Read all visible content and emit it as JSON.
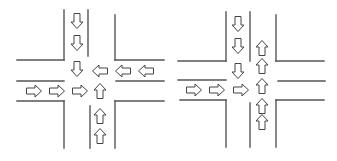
{
  "colors": {
    "background": "#ffffff",
    "road_line": "#555555",
    "arrow_outline": "#444444",
    "arrow_fill": "#ffffff"
  },
  "diagrams": [
    {
      "id": "left-intersection",
      "road_lines": [
        {
          "x1": 64,
          "y1": 10,
          "x2": 64,
          "y2": 60
        },
        {
          "x1": 17,
          "y1": 60,
          "x2": 64,
          "y2": 60
        },
        {
          "x1": 88,
          "y1": 10,
          "x2": 88,
          "y2": 56
        },
        {
          "x1": 115,
          "y1": 15,
          "x2": 115,
          "y2": 60
        },
        {
          "x1": 115,
          "y1": 60,
          "x2": 164,
          "y2": 60
        },
        {
          "x1": 17,
          "y1": 81,
          "x2": 64,
          "y2": 81
        },
        {
          "x1": 116,
          "y1": 81,
          "x2": 164,
          "y2": 81
        },
        {
          "x1": 17,
          "y1": 101,
          "x2": 64,
          "y2": 101
        },
        {
          "x1": 64,
          "y1": 101,
          "x2": 64,
          "y2": 148
        },
        {
          "x1": 90,
          "y1": 106,
          "x2": 90,
          "y2": 148
        },
        {
          "x1": 115,
          "y1": 101,
          "x2": 164,
          "y2": 101
        },
        {
          "x1": 115,
          "y1": 101,
          "x2": 115,
          "y2": 148
        }
      ],
      "arrows": [
        {
          "dir": "down",
          "cx": 77,
          "cy": 21
        },
        {
          "dir": "down",
          "cx": 77,
          "cy": 43
        },
        {
          "dir": "down",
          "cx": 77,
          "cy": 69
        },
        {
          "dir": "left",
          "cx": 100,
          "cy": 71
        },
        {
          "dir": "left",
          "cx": 123,
          "cy": 71
        },
        {
          "dir": "left",
          "cx": 146,
          "cy": 71
        },
        {
          "dir": "right",
          "cx": 34,
          "cy": 91
        },
        {
          "dir": "right",
          "cx": 57,
          "cy": 91
        },
        {
          "dir": "right",
          "cx": 80,
          "cy": 91
        },
        {
          "dir": "up",
          "cx": 100,
          "cy": 91
        },
        {
          "dir": "up",
          "cx": 100,
          "cy": 116
        },
        {
          "dir": "up",
          "cx": 100,
          "cy": 136
        }
      ]
    },
    {
      "id": "right-intersection",
      "road_lines": [
        {
          "x1": 226,
          "y1": 12,
          "x2": 226,
          "y2": 61
        },
        {
          "x1": 178,
          "y1": 61,
          "x2": 226,
          "y2": 61
        },
        {
          "x1": 250,
          "y1": 12,
          "x2": 250,
          "y2": 61
        },
        {
          "x1": 276,
          "y1": 15,
          "x2": 276,
          "y2": 61
        },
        {
          "x1": 276,
          "y1": 61,
          "x2": 324,
          "y2": 61
        },
        {
          "x1": 178,
          "y1": 80,
          "x2": 226,
          "y2": 80
        },
        {
          "x1": 278,
          "y1": 81,
          "x2": 325,
          "y2": 81
        },
        {
          "x1": 180,
          "y1": 100,
          "x2": 226,
          "y2": 100
        },
        {
          "x1": 226,
          "y1": 100,
          "x2": 226,
          "y2": 147
        },
        {
          "x1": 250,
          "y1": 103,
          "x2": 250,
          "y2": 147
        },
        {
          "x1": 276,
          "y1": 100,
          "x2": 324,
          "y2": 100
        },
        {
          "x1": 276,
          "y1": 100,
          "x2": 276,
          "y2": 147
        }
      ],
      "arrows": [
        {
          "dir": "down",
          "cx": 238,
          "cy": 24
        },
        {
          "dir": "down",
          "cx": 238,
          "cy": 46
        },
        {
          "dir": "down",
          "cx": 238,
          "cy": 71
        },
        {
          "dir": "up",
          "cx": 262,
          "cy": 48
        },
        {
          "dir": "up",
          "cx": 262,
          "cy": 66
        },
        {
          "dir": "up",
          "cx": 262,
          "cy": 86
        },
        {
          "dir": "up",
          "cx": 262,
          "cy": 106
        },
        {
          "dir": "up",
          "cx": 262,
          "cy": 122
        },
        {
          "dir": "right",
          "cx": 194,
          "cy": 90
        },
        {
          "dir": "right",
          "cx": 217,
          "cy": 90
        },
        {
          "dir": "right",
          "cx": 241,
          "cy": 90
        }
      ]
    }
  ]
}
